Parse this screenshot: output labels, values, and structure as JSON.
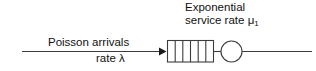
{
  "diagram": {
    "type": "queueing-network",
    "labels": {
      "service_line1": "Exponential",
      "service_line2_prefix": "service rate ",
      "service_symbol": "μ",
      "service_symbol_subscript": "1",
      "arrival_line1": "Poisson arrivals",
      "arrival_line2": "rate λ"
    },
    "colors": {
      "stroke": "#3c3c3c",
      "background": "#ffffff",
      "text": "#111111"
    },
    "queue": {
      "cells": 6,
      "dividers": 5
    },
    "server": {
      "shape": "circle"
    }
  }
}
